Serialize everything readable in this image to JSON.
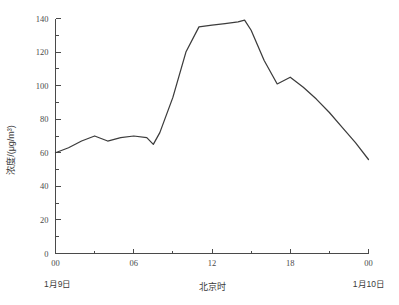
{
  "chart_data": {
    "type": "line",
    "title": "",
    "subtitle": "",
    "xlabel": "北京时",
    "ylabel": "浓度/(μg/m³)",
    "xlim": [
      0,
      24
    ],
    "ylim": [
      0,
      140
    ],
    "grid": false,
    "legend": null,
    "legend_position": "none",
    "line_color": "#3c3c3c",
    "axis_color": "#4a4a4a",
    "x_tick_labels": [
      "00",
      "06",
      "12",
      "18",
      "00"
    ],
    "x_tick_values": [
      0,
      6,
      12,
      18,
      24
    ],
    "x_minor_step": 3,
    "y_tick_labels": [
      "0",
      "20",
      "40",
      "60",
      "80",
      "100",
      "120",
      "140"
    ],
    "y_tick_values": [
      0,
      20,
      40,
      60,
      80,
      100,
      120,
      140
    ],
    "y_minor_step": 10,
    "annotations": [
      {
        "name": "start-date",
        "text": "1月9日",
        "x": 0,
        "position": "below-axis-left"
      },
      {
        "name": "end-date",
        "text": "1月10日",
        "x": 24,
        "position": "below-axis-right"
      }
    ],
    "x": [
      0,
      1,
      2,
      3,
      4,
      5,
      6,
      7,
      7.5,
      8,
      9,
      10,
      11,
      12,
      13,
      14,
      14.5,
      15,
      16,
      17,
      18,
      19,
      20,
      21,
      22,
      23,
      24
    ],
    "values": [
      60,
      63,
      67,
      70,
      67,
      69,
      70,
      69,
      65,
      72,
      93,
      120,
      135,
      136,
      137,
      138,
      139,
      133,
      115,
      101,
      105,
      99,
      92,
      84,
      75,
      66,
      56
    ],
    "series": [
      {
        "name": "浓度",
        "unit": "μg/m³",
        "values": [
          60,
          63,
          67,
          70,
          67,
          69,
          70,
          69,
          65,
          72,
          93,
          120,
          135,
          136,
          137,
          138,
          139,
          133,
          115,
          101,
          105,
          99,
          92,
          84,
          75,
          66,
          56
        ]
      }
    ]
  },
  "axes": {
    "y_axis_label": "浓度/(μg/m³)",
    "x_axis_label": "北京时",
    "left_date": "1月9日",
    "right_date": "1月10日"
  }
}
